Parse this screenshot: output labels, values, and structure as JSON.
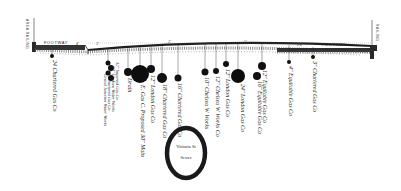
{
  "diagram": {
    "type": "street cross-section showing underground pipes",
    "left": {
      "railing_label": "AREA RAILING",
      "footway_label": "FOOTWAY"
    },
    "right": {
      "railing_label": "RAILING",
      "footway_label": "FOOTWAY"
    },
    "measurements": [
      "4'",
      "3'",
      "3'6\"",
      "4'",
      "3'",
      "2'6\"",
      "2'",
      "3'",
      "4'",
      "2'6\"",
      "5'",
      "2'",
      "2'6\"",
      "3'",
      "4'",
      "3'",
      "2'6\"",
      "6'"
    ],
    "pipes": [
      {
        "label": "24 Chartered Gas Co",
        "x": 52,
        "y": 56,
        "r": 2
      },
      {
        "label": "12\" Imperial Gas Co",
        "x": 108,
        "y": 63,
        "r": 2.5
      },
      {
        "label": "30\" Chelsea Water Works",
        "x": 111,
        "y": 68,
        "r": 3
      },
      {
        "label": "12\" Chartered Gas Co",
        "x": 108,
        "y": 73,
        "r": 2.5
      },
      {
        "label": "Grand Junction Water Works",
        "x": 111,
        "y": 78,
        "r": 3
      },
      {
        "label": "Drain",
        "x": 128,
        "y": 72,
        "r": 4
      },
      {
        "label": "E. Gas C. Proposed 30\" Main",
        "x": 140,
        "y": 74,
        "r": 9
      },
      {
        "label": "12\" London Gas Co",
        "x": 151,
        "y": 69,
        "r": 4
      },
      {
        "label": "18\" Chartered Gas Co",
        "x": 162,
        "y": 78,
        "r": 5
      },
      {
        "label": "16\" Chartered Gas Co",
        "x": 178,
        "y": 78,
        "r": 3.5
      },
      {
        "label": "10\" Chelsea W Works",
        "x": 205,
        "y": 72,
        "r": 3.5
      },
      {
        "label": "12\" Chelsea W Works Co",
        "x": 216,
        "y": 71,
        "r": 3
      },
      {
        "label": "12\" London Gas Co",
        "x": 226,
        "y": 64,
        "r": 3
      },
      {
        "label": "24\" London Gas Co",
        "x": 238,
        "y": 76,
        "r": 7
      },
      {
        "label": "12\" Equitable Gas Co",
        "x": 262,
        "y": 66,
        "r": 4
      },
      {
        "label": "16\" Equitable Gas Co",
        "x": 257,
        "y": 76,
        "r": 4
      },
      {
        "label": "4\" Equitable Gas Co",
        "x": 289,
        "y": 62,
        "r": 2
      },
      {
        "label": "3\" Chartered Gas Co",
        "x": 313,
        "y": 57,
        "r": 2
      }
    ],
    "sewer": {
      "line1": "Victoria St",
      "line2": "Sewer"
    }
  }
}
